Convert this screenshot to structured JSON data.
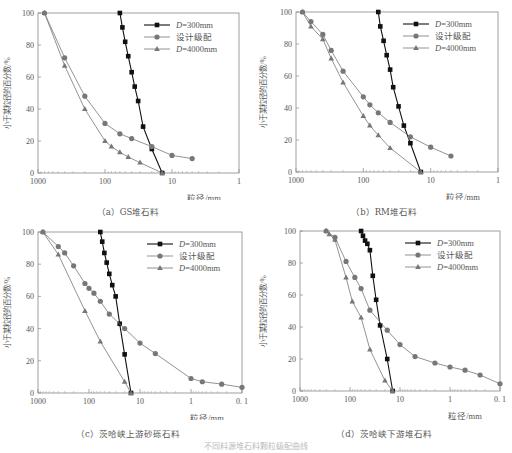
{
  "figure_caption": "不同料源堆石料颗粒级配曲线",
  "chart_data": [
    {
      "type": "line",
      "panel": "a",
      "title": "（a）GS堆石料",
      "xlabel": "粒径/mm",
      "ylabel": "小于某粒径的百分数/%",
      "xscale": "log",
      "xlim": [
        1000,
        1
      ],
      "ylim": [
        0,
        100
      ],
      "xticks": [
        "1000",
        "100",
        "10",
        "1"
      ],
      "yticks": [
        "0",
        "20",
        "40",
        "60",
        "80",
        "100"
      ],
      "legend": [
        "D=300mm",
        "设计级配",
        "D=4000mm"
      ],
      "legend_position": "upper right",
      "series": [
        {
          "name": "D=300mm",
          "marker": "square",
          "color": "#111111",
          "x": [
            60,
            55,
            50,
            45,
            40,
            36,
            32,
            27,
            20,
            14
          ],
          "y": [
            100,
            91,
            82,
            73,
            63,
            54,
            45,
            29,
            15,
            0
          ]
        },
        {
          "name": "设计级配",
          "marker": "circle",
          "color": "#777777",
          "x": [
            800,
            400,
            200,
            100,
            60,
            40,
            20,
            10,
            5
          ],
          "y": [
            100,
            72,
            48,
            31,
            24.5,
            21.5,
            16.5,
            11,
            9
          ]
        },
        {
          "name": "D=4000mm",
          "marker": "triangle",
          "color": "#777777",
          "x": [
            800,
            400,
            200,
            100,
            80,
            60,
            45,
            30,
            14
          ],
          "y": [
            100,
            67,
            40,
            20,
            16.5,
            13,
            10,
            6.5,
            0
          ]
        }
      ]
    },
    {
      "type": "line",
      "panel": "b",
      "title": "（b）RM堆石料",
      "xlabel": "粒径/mm",
      "ylabel": "小于某粒径的百分数/%",
      "xscale": "log",
      "xlim": [
        1000,
        1
      ],
      "ylim": [
        0,
        100
      ],
      "xticks": [
        "1000",
        "100",
        "10",
        "1"
      ],
      "yticks": [
        "0",
        "20",
        "40",
        "60",
        "80",
        "100"
      ],
      "legend": [
        "D=300mm",
        "设计级配",
        "D=4000mm"
      ],
      "legend_position": "upper right",
      "series": [
        {
          "name": "D=300mm",
          "marker": "square",
          "color": "#111111",
          "x": [
            60,
            56,
            50,
            45,
            40,
            36,
            30,
            25,
            20,
            14
          ],
          "y": [
            100,
            91,
            82,
            73,
            64,
            53,
            41,
            29,
            18,
            0
          ]
        },
        {
          "name": "设计级配",
          "marker": "circle",
          "color": "#777777",
          "x": [
            800,
            600,
            400,
            300,
            200,
            100,
            80,
            60,
            40,
            20,
            10,
            5
          ],
          "y": [
            100,
            94,
            86,
            76,
            63,
            47,
            42,
            37,
            31,
            22,
            15.5,
            10
          ]
        },
        {
          "name": "D=4000mm",
          "marker": "triangle",
          "color": "#777777",
          "x": [
            800,
            600,
            400,
            300,
            200,
            100,
            80,
            60,
            40,
            14
          ],
          "y": [
            100,
            91,
            83,
            71,
            56,
            35,
            29,
            23,
            15,
            0
          ]
        }
      ]
    },
    {
      "type": "line",
      "panel": "c",
      "title": "（c）茨哈峡上游砂砾石料",
      "xlabel": "粒径/mm",
      "ylabel": "小于某粒径的百分数/%",
      "xscale": "log",
      "xlim": [
        1000,
        0.1
      ],
      "ylim": [
        0,
        100
      ],
      "xticks": [
        "1000",
        "100",
        "10",
        "1",
        "0.1"
      ],
      "yticks": [
        "0",
        "20",
        "40",
        "60",
        "80",
        "100"
      ],
      "legend": [
        "D=300mm",
        "设计级配",
        "D=4000mm"
      ],
      "legend_position": "upper right",
      "series": [
        {
          "name": "D=300mm",
          "marker": "square",
          "color": "#111111",
          "x": [
            60,
            55,
            50,
            45,
            40,
            35,
            30,
            25,
            20,
            15
          ],
          "y": [
            100,
            94,
            87,
            81,
            74,
            67,
            60,
            43,
            24,
            0
          ]
        },
        {
          "name": "设计级配",
          "marker": "circle",
          "color": "#777777",
          "x": [
            800,
            400,
            300,
            200,
            120,
            100,
            80,
            60,
            40,
            20,
            10,
            5,
            1,
            0.6,
            0.25,
            0.1
          ],
          "y": [
            100,
            91,
            87,
            79,
            68,
            65,
            62,
            57,
            49,
            40,
            31,
            24.5,
            9,
            7,
            5.5,
            3.5
          ]
        },
        {
          "name": "D=4000mm",
          "marker": "triangle",
          "color": "#777777",
          "x": [
            800,
            400,
            120,
            60,
            20,
            15
          ],
          "y": [
            100,
            86,
            51,
            32,
            7,
            0
          ]
        }
      ]
    },
    {
      "type": "line",
      "panel": "d",
      "title": "（d）茨哈峡下游堆石料",
      "xlabel": "粒径/mm",
      "ylabel": "小于某粒径的百分数/%",
      "xscale": "log",
      "xlim": [
        1000,
        0.1
      ],
      "ylim": [
        0,
        100
      ],
      "xticks": [
        "1000",
        "100",
        "10",
        "1",
        "0.1"
      ],
      "yticks": [
        "0",
        "20",
        "40",
        "60",
        "80",
        "100"
      ],
      "legend": [
        "D=300mm",
        "设计级配",
        "D=4000mm"
      ],
      "legend_position": "upper right",
      "series": [
        {
          "name": "D=300mm",
          "marker": "square",
          "color": "#111111",
          "x": [
            60,
            55,
            50,
            45,
            40,
            35,
            30,
            25,
            18,
            14
          ],
          "y": [
            100,
            97,
            94,
            92,
            88,
            72,
            57,
            41,
            20,
            0
          ]
        },
        {
          "name": "设计级配",
          "marker": "circle",
          "color": "#777777",
          "x": [
            300,
            200,
            120,
            80,
            60,
            40,
            18,
            10,
            5,
            2,
            1,
            0.5,
            0.25,
            0.1
          ],
          "y": [
            100,
            96,
            81,
            71,
            64,
            50.5,
            38,
            29,
            21.5,
            17.5,
            15,
            13,
            10,
            4.5
          ]
        },
        {
          "name": "D=4000mm",
          "marker": "triangle",
          "color": "#777777",
          "x": [
            300,
            260,
            200,
            120,
            90,
            60,
            40,
            20,
            14
          ],
          "y": [
            100,
            98,
            94.5,
            71,
            56,
            46,
            26,
            6.5,
            0
          ]
        }
      ]
    }
  ],
  "panels": [
    {
      "caption": "（a）GS堆石料"
    },
    {
      "caption": "（b）RM堆石料"
    },
    {
      "caption": "（c）茨哈峡上游砂砾石料"
    },
    {
      "caption": "（d）茨哈峡下游堆石料"
    }
  ]
}
